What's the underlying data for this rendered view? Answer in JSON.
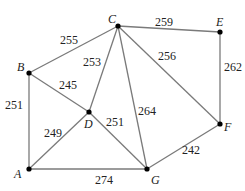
{
  "graph": {
    "nodes": [
      {
        "id": "A",
        "label": "A",
        "x": 29,
        "y": 169,
        "lx": 14,
        "ly": 178
      },
      {
        "id": "B",
        "label": "B",
        "x": 29,
        "y": 73,
        "lx": 17,
        "ly": 71
      },
      {
        "id": "C",
        "label": "C",
        "x": 118,
        "y": 26,
        "lx": 108,
        "ly": 23
      },
      {
        "id": "D",
        "label": "D",
        "x": 89,
        "y": 112,
        "lx": 84,
        "ly": 128
      },
      {
        "id": "E",
        "label": "E",
        "x": 220,
        "y": 32,
        "lx": 216,
        "ly": 26
      },
      {
        "id": "F",
        "label": "F",
        "x": 220,
        "y": 124,
        "lx": 224,
        "ly": 131
      },
      {
        "id": "G",
        "label": "G",
        "x": 147,
        "y": 169,
        "lx": 151,
        "ly": 184
      }
    ],
    "edges": [
      {
        "from": "B",
        "to": "C",
        "weight": "255",
        "lx": 60,
        "ly": 44
      },
      {
        "from": "C",
        "to": "E",
        "weight": "259",
        "lx": 155,
        "ly": 26
      },
      {
        "from": "E",
        "to": "F",
        "weight": "262",
        "lx": 224,
        "ly": 71
      },
      {
        "from": "C",
        "to": "F",
        "weight": "256",
        "lx": 158,
        "ly": 60
      },
      {
        "from": "C",
        "to": "D",
        "weight": "253",
        "lx": 83,
        "ly": 66
      },
      {
        "from": "C",
        "to": "G",
        "weight": "264",
        "lx": 138,
        "ly": 115
      },
      {
        "from": "B",
        "to": "D",
        "weight": "245",
        "lx": 59,
        "ly": 89
      },
      {
        "from": "B",
        "to": "A",
        "weight": "251",
        "lx": 5,
        "ly": 109
      },
      {
        "from": "A",
        "to": "D",
        "weight": "249",
        "lx": 44,
        "ly": 137
      },
      {
        "from": "D",
        "to": "G",
        "weight": "251",
        "lx": 106,
        "ly": 126
      },
      {
        "from": "A",
        "to": "G",
        "weight": "274",
        "lx": 95,
        "ly": 184
      },
      {
        "from": "G",
        "to": "F",
        "weight": "242",
        "lx": 182,
        "ly": 154
      }
    ]
  }
}
